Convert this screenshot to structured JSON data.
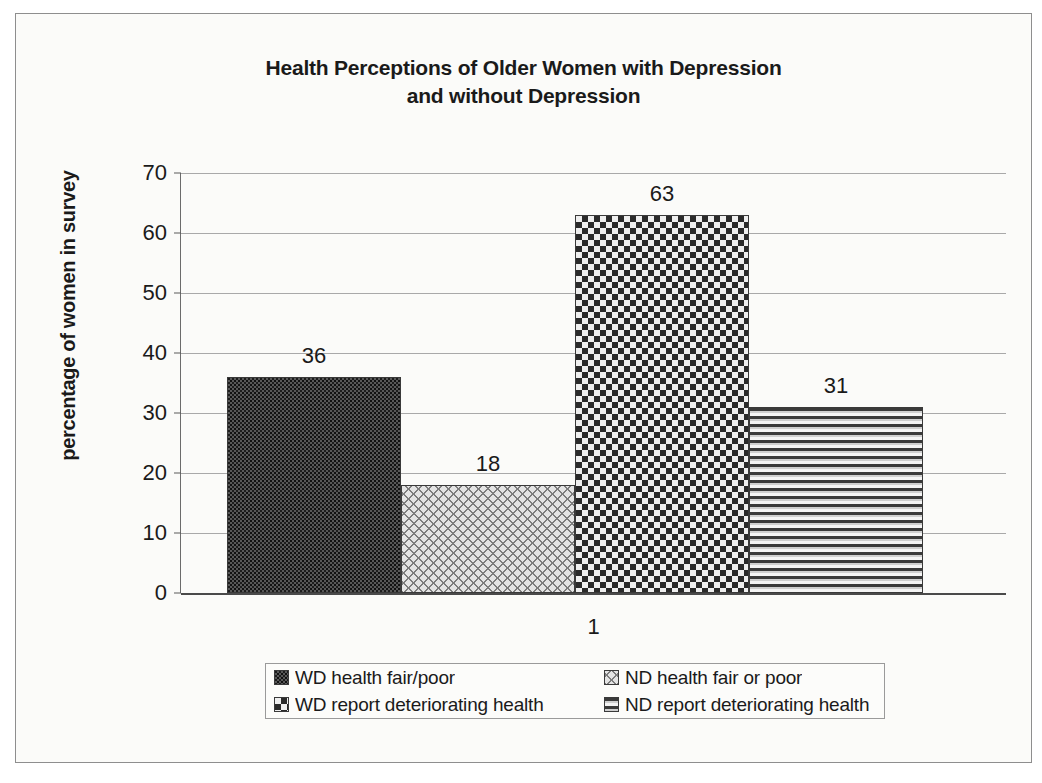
{
  "chart_data": {
    "type": "bar",
    "title": "Health Perceptions of Older Women with Depression and without Depression",
    "title_line1": "Health Perceptions of Older Women with Depression",
    "title_line2": "and without Depression",
    "xlabel": "",
    "ylabel": "percentage of women in survey",
    "categories": [
      "1"
    ],
    "ylim": [
      0,
      70
    ],
    "ytick_labels": [
      "70",
      "60",
      "50",
      "40",
      "30",
      "20",
      "10",
      "0"
    ],
    "ytick_values": [
      70,
      60,
      50,
      40,
      30,
      20,
      10,
      0
    ],
    "grid": true,
    "legend_position": "bottom",
    "series": [
      {
        "name": "WD health fair/poor",
        "values": [
          36
        ],
        "label": "36",
        "pattern": "dark-speckle"
      },
      {
        "name": "ND health fair or poor",
        "values": [
          18
        ],
        "label": "18",
        "pattern": "diagonal-wave"
      },
      {
        "name": "WD report deteriorating health",
        "values": [
          63
        ],
        "label": "63",
        "pattern": "checkerboard"
      },
      {
        "name": "ND report deteriorating health",
        "values": [
          31
        ],
        "label": "31",
        "pattern": "horizontal-stripes"
      }
    ]
  },
  "legend": {
    "items": [
      {
        "label": "WD health fair/poor"
      },
      {
        "label": "ND health fair or poor"
      },
      {
        "label": "WD report deteriorating health"
      },
      {
        "label": "ND report deteriorating health"
      }
    ]
  },
  "colors": {
    "background": "#fbfbf9",
    "border": "#8e8e8e",
    "text": "#1a1a1a",
    "gridline": "#a9a9a9",
    "axis": "#4a4a4a"
  }
}
